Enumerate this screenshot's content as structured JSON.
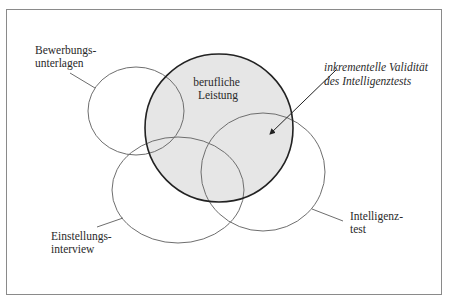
{
  "diagram": {
    "type": "venn",
    "frame": {
      "x": 6,
      "y": 9,
      "width": 436,
      "height": 286,
      "stroke": "#8a8a8a"
    },
    "colors": {
      "criterion_fill": "#e6e6e6",
      "criterion_stroke": "#222222",
      "predictor_stroke": "#6e6e6e",
      "text": "#2a2a2a"
    },
    "criterion": {
      "name": "berufliche Leistung",
      "lines": [
        "berufliche",
        "Leistung"
      ],
      "cx": 219,
      "cy": 128,
      "r": 74
    },
    "predictors": [
      {
        "id": "bewerbungsunterlagen",
        "lines": [
          "Bewerbungs-",
          "unterlagen"
        ],
        "cx": 136,
        "cy": 111,
        "rx": 48,
        "ry": 44
      },
      {
        "id": "einstellungsinterview",
        "lines": [
          "Einstellungs-",
          "interview"
        ],
        "cx": 178,
        "cy": 190,
        "rx": 66,
        "ry": 53
      },
      {
        "id": "intelligenztest",
        "lines": [
          "Intelligenz-",
          "test"
        ],
        "cx": 263,
        "cy": 172,
        "rx": 62,
        "ry": 59
      }
    ],
    "annotation": {
      "lines": [
        "inkrementelle Validität",
        "des Intelligenztests"
      ],
      "arrow_from": [
        336,
        70
      ],
      "arrow_to": [
        268,
        136
      ]
    }
  }
}
